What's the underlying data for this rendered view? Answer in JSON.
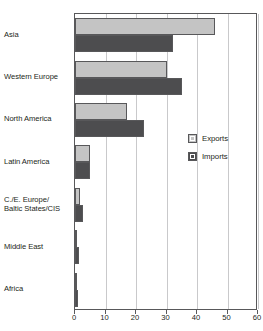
{
  "top_fragment": "",
  "legend": {
    "position": "inside-right",
    "items": [
      {
        "label": "Exports",
        "swatch": "exports-swatch",
        "color": "#c4c4c4"
      },
      {
        "label": "Imports",
        "swatch": "imports-swatch",
        "color": "#4d4d4f"
      }
    ]
  },
  "chart_data": {
    "type": "bar",
    "orientation": "horizontal",
    "title": "",
    "subtitle": "",
    "xlabel": "",
    "ylabel": "",
    "xlim": [
      0,
      60
    ],
    "xticks": [
      0,
      10,
      20,
      30,
      40,
      50,
      60
    ],
    "xtick_labels": [
      "0",
      "10",
      "20",
      "30",
      "40",
      "50",
      "60"
    ],
    "grid": "vertical",
    "legend_position": "inside-right",
    "categories": [
      "Asia",
      "Western Europe",
      "North America",
      "Latin America",
      "C./E. Europe/ Baltic States/CIS",
      "Middle East",
      "Africa"
    ],
    "category_lines": [
      [
        "Asia"
      ],
      [
        "Western Europe"
      ],
      [
        "North America"
      ],
      [
        "Latin America"
      ],
      [
        "C./E. Europe/",
        "Baltic States/CIS"
      ],
      [
        "Middle East"
      ],
      [
        "Africa"
      ]
    ],
    "series": [
      {
        "name": "Exports",
        "color": "#c4c4c4",
        "values": [
          46,
          30,
          17,
          5,
          1.5,
          0.5,
          0.3
        ]
      },
      {
        "name": "Imports",
        "color": "#4d4d4f",
        "values": [
          32,
          35,
          22.5,
          5,
          2.5,
          1.3,
          1
        ]
      }
    ]
  }
}
